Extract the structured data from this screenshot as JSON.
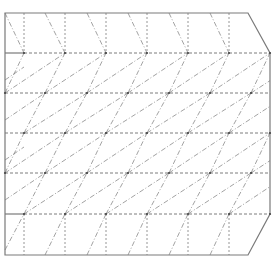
{
  "diagram": {
    "type": "crease-pattern",
    "stroke_colors": {
      "outline": "#7a7a7a",
      "fold": "#6e6e6e",
      "diagonal": "#8a8a8a",
      "node": "#444444"
    },
    "outline_points": [
      [
        5,
        13
      ],
      [
        248,
        13
      ],
      [
        270,
        53
      ],
      [
        270,
        214
      ],
      [
        248,
        255
      ],
      [
        5,
        255
      ]
    ],
    "solid_segments": [
      [
        5,
        53,
        24,
        53
      ],
      [
        5,
        214,
        24,
        214
      ]
    ],
    "rows": [
      {
        "y": 53,
        "nodes_x": [
          24,
          65,
          106,
          147,
          188,
          229,
          270
        ]
      },
      {
        "y": 93,
        "nodes_x": [
          5,
          45,
          87,
          128,
          169,
          210,
          251
        ]
      },
      {
        "y": 133,
        "nodes_x": [
          24,
          65,
          106,
          147,
          188,
          229,
          270
        ]
      },
      {
        "y": 173,
        "nodes_x": [
          5,
          45,
          87,
          128,
          169,
          210,
          251
        ]
      },
      {
        "y": 214,
        "nodes_x": [
          24,
          65,
          106,
          147,
          188,
          229,
          270
        ]
      }
    ],
    "top_band": {
      "y_top": 13,
      "y_bottom": 53,
      "verticals_x": [
        24,
        65,
        106,
        147,
        188,
        229
      ],
      "diagonals": [
        [
          5,
          13,
          24,
          53
        ],
        [
          45,
          13,
          65,
          53
        ],
        [
          87,
          13,
          106,
          53
        ],
        [
          128,
          13,
          147,
          53
        ],
        [
          169,
          13,
          188,
          53
        ],
        [
          210,
          13,
          229,
          53
        ]
      ]
    },
    "bottom_band": {
      "y_top": 214,
      "y_bottom": 255,
      "verticals_x": [
        24,
        65,
        106,
        147,
        188,
        229
      ],
      "diagonals": [
        [
          5,
          250,
          24,
          214
        ],
        [
          45,
          255,
          65,
          214
        ],
        [
          87,
          255,
          106,
          214
        ],
        [
          128,
          255,
          147,
          214
        ],
        [
          169,
          255,
          188,
          214
        ],
        [
          210,
          255,
          229,
          214
        ]
      ]
    }
  }
}
